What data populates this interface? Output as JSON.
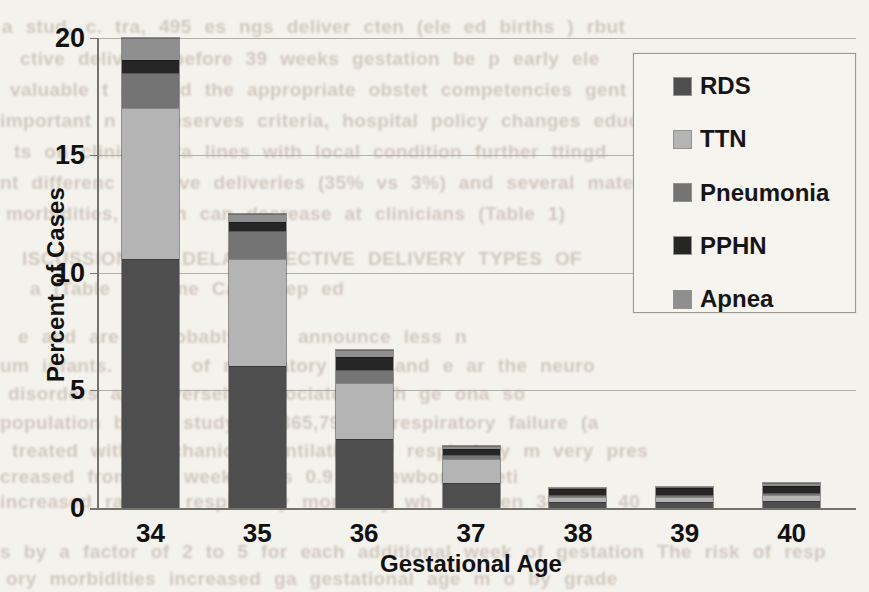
{
  "page": {
    "kind": "scanned textbook page with chart overlaying bleed-through text"
  },
  "chart_data": {
    "type": "bar",
    "stacked": true,
    "title": "",
    "xlabel": "Gestational Age",
    "ylabel": "Percent of Cases",
    "categories": [
      "34",
      "35",
      "36",
      "37",
      "38",
      "39",
      "40"
    ],
    "series": [
      {
        "name": "RDS",
        "color": "#4e4e4e",
        "values": [
          10.6,
          6.05,
          2.95,
          1.05,
          0.25,
          0.25,
          0.3
        ]
      },
      {
        "name": "TTN",
        "color": "#b4b4b4",
        "values": [
          6.4,
          4.55,
          2.35,
          1.05,
          0.2,
          0.2,
          0.25
        ]
      },
      {
        "name": "Pneumonia",
        "color": "#747474",
        "values": [
          1.5,
          1.15,
          0.55,
          0.15,
          0.1,
          0.1,
          0.1
        ]
      },
      {
        "name": "PPHN",
        "color": "#262626",
        "values": [
          0.55,
          0.4,
          0.55,
          0.25,
          0.25,
          0.3,
          0.3
        ]
      },
      {
        "name": "Apnea",
        "color": "#8f8f8f",
        "values": [
          0.95,
          0.35,
          0.3,
          0.15,
          0.05,
          0.05,
          0.1
        ]
      }
    ],
    "totals_by_category": [
      20.0,
      12.5,
      6.7,
      2.65,
      0.85,
      0.9,
      1.05
    ],
    "yticks": [
      0,
      5,
      10,
      15,
      20
    ],
    "ylim": [
      0,
      20
    ],
    "grid": true,
    "legend_position": "upper right",
    "palette_note": "grayscale scan"
  },
  "bleedthrough_text_fragments": {
    "note": "faint, mostly illegible text showing through the scanned page",
    "lines": [
      {
        "x": 2,
        "y": 16,
        "text": "a stud, c. tra, 495 es  ngs  deliver  cten (ele ed births )                             rbut"
      },
      {
        "x": 20,
        "y": 48,
        "text": "ctive delivery) before 39 weeks  gestation be p          early ele"
      },
      {
        "x": 10,
        "y": 79,
        "text": "valuable t   ed and the appropriate obstet  competencies    gent   T  V"
      },
      {
        "x": 0,
        "y": 110,
        "text": "important  n as  reserves criteria, hospital policy  changes     educationa"
      },
      {
        "x": 14,
        "y": 141,
        "text": "ts on clinical pra  lines  with local condition              further   ttingd"
      },
      {
        "x": 0,
        "y": 172,
        "text": "nt differenc   elective deliveries (35% vs 3%) and several maternal and neonata"
      },
      {
        "x": 6,
        "y": 203,
        "text": "morbidities, which can decrease  at clinicians (Table 1)"
      },
      {
        "x": 22,
        "y": 248,
        "text": "ISCUSSION TO DELAY     ELECTIVE  DELIVERY  TYPES  OF"
      },
      {
        "x": 30,
        "y": 278,
        "text": "a  (Table and   me  Case  Rep  ed"
      },
      {
        "x": 18,
        "y": 326,
        "text": "e  and  are  improbably  e  s  announce   less n"
      },
      {
        "x": 0,
        "y": 355,
        "text": "um infants. Rates of respiratory  orde  and  e  ar  the neuro"
      },
      {
        "x": 8,
        "y": 383,
        "text": "disorders are inversely associated with ge  ona   so"
      },
      {
        "x": 0,
        "y": 412,
        "text": "population  based study of 365,790 w   respiratory failure (a"
      },
      {
        "x": 12,
        "y": 440,
        "text": "treated with mechanical ventilation  of respiratory m   very pres"
      },
      {
        "x": 0,
        "y": 466,
        "text": "creased from 0.1   weeks  was  0.9 to   newborns  neti"
      },
      {
        "x": 0,
        "y": 491,
        "text": "increased  rate of respiratory morbidity  wh  between 34 and 40"
      },
      {
        "x": 0,
        "y": 541,
        "text": "s by a factor of 2 to 5 for each additional week of gestation   The risk of resp"
      },
      {
        "x": 6,
        "y": 568,
        "text": "ory morbidities increased  ga  gestational age  m  o  by grade"
      }
    ]
  }
}
